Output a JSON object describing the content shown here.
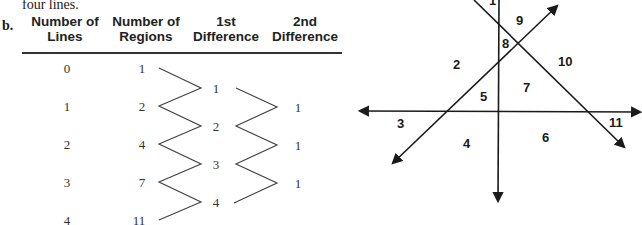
{
  "text": {
    "intro": "four lines.",
    "part_label": "b."
  },
  "table": {
    "headers": [
      {
        "line1": "Number of",
        "line2": "Lines"
      },
      {
        "line1": "Number of",
        "line2": "Regions"
      },
      {
        "line1": "1st",
        "line2": "Difference"
      },
      {
        "line1": "2nd",
        "line2": "Difference"
      }
    ],
    "lines": [
      "0",
      "1",
      "2",
      "3",
      "4"
    ],
    "regions": [
      "1",
      "2",
      "4",
      "7",
      "11"
    ],
    "first_difference": [
      "1",
      "2",
      "3",
      "4"
    ],
    "second_difference": [
      "1",
      "1",
      "1"
    ]
  },
  "diagram": {
    "region_labels": [
      {
        "id": "1",
        "x": 489,
        "y": 4
      },
      {
        "id": "2",
        "x": 453,
        "y": 70
      },
      {
        "id": "3",
        "x": 397,
        "y": 129
      },
      {
        "id": "4",
        "x": 463,
        "y": 149
      },
      {
        "id": "5",
        "x": 480,
        "y": 101
      },
      {
        "id": "6",
        "x": 543,
        "y": 143
      },
      {
        "id": "7",
        "x": 523,
        "y": 92
      },
      {
        "id": "8",
        "x": 500,
        "y": 48
      },
      {
        "id": "9",
        "x": 514,
        "y": 26
      },
      {
        "id": "10",
        "x": 565,
        "y": 66
      },
      {
        "id": "11",
        "x": 608,
        "y": 128
      }
    ]
  }
}
